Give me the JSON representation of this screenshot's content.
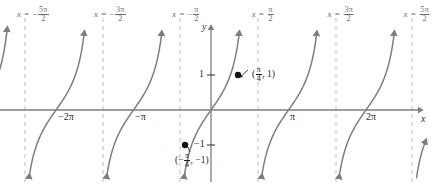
{
  "figure": {
    "background_color": "#ffffff",
    "curve_color": "#7a7f83",
    "axis_color": "#7a7f83",
    "asymptote_color": "#b9bdc0",
    "point_color": "#111111"
  },
  "axes": {
    "x_letter": "x",
    "y_letter": "y",
    "x_axis_y_px": 110,
    "y_axis_x_px": 211,
    "px_per_unit_x": 24.67,
    "px_per_unit_y": 35
  },
  "x_ticks": [
    {
      "label": "−2π",
      "value": -6.2832,
      "x_px": 56
    },
    {
      "label": "−π",
      "value": -3.1416,
      "x_px": 133
    },
    {
      "label": "π",
      "value": 3.1416,
      "x_px": 288
    },
    {
      "label": "2π",
      "value": 6.2832,
      "x_px": 365
    }
  ],
  "y_ticks": [
    {
      "label": "1",
      "value": 1,
      "y_px": 75
    },
    {
      "label": "−1",
      "value": -1,
      "y_px": 145
    }
  ],
  "asymptotes": [
    {
      "id": "a-5pi-2",
      "sign": "−",
      "numerator": "5π",
      "denominator": "2",
      "equals": "x =",
      "value": -7.854,
      "x_px": 25,
      "label_x_px": 33,
      "label_y_px": 6
    },
    {
      "id": "a-3pi-2",
      "sign": "−",
      "numerator": "3π",
      "denominator": "2",
      "equals": "x =",
      "value": -4.712,
      "x_px": 103,
      "label_x_px": 110,
      "label_y_px": 6
    },
    {
      "id": "a-1pi-2",
      "sign": "−",
      "numerator": "π",
      "denominator": "2",
      "equals": "x =",
      "value": -1.571,
      "x_px": 180,
      "label_x_px": 186,
      "label_y_px": 6
    },
    {
      "id": "a+1pi-2",
      "sign": "",
      "numerator": "π",
      "denominator": "2",
      "equals": "x =",
      "value": 1.571,
      "x_px": 258,
      "label_x_px": 263,
      "label_y_px": 6
    },
    {
      "id": "a+3pi-2",
      "sign": "",
      "numerator": "3π",
      "denominator": "2",
      "equals": "x =",
      "value": 4.712,
      "x_px": 336,
      "label_x_px": 341,
      "label_y_px": 6
    },
    {
      "id": "a+5pi-2",
      "sign": "",
      "numerator": "5π",
      "denominator": "2",
      "equals": "x =",
      "value": 7.854,
      "x_px": 412,
      "label_x_px": 417,
      "label_y_px": 6
    }
  ],
  "points": [
    {
      "id": "p-positive",
      "open_paren": "(",
      "sign": "",
      "numerator": "π",
      "denominator": "4",
      "rest": ", 1)",
      "x_value": 0.7854,
      "y_value": 1,
      "x_px": 238,
      "y_px": 75,
      "label_x_px": 252,
      "label_y_px": 68,
      "leader_to_x": 248,
      "leader_to_y": 70
    },
    {
      "id": "p-negative",
      "open_paren": "(",
      "sign": "−",
      "numerator": "π",
      "denominator": "4",
      "rest": ", −1)",
      "x_value": -0.7854,
      "y_value": -1,
      "x_px": 185,
      "y_px": 145,
      "label_x_px": 177,
      "label_y_px": 153,
      "leader_to_x": 190,
      "leader_to_y": 152
    }
  ],
  "chart_data": {
    "type": "line",
    "xlabel": "x",
    "ylabel": "y",
    "xlim": [
      -8.7,
      8.7
    ],
    "ylim": [
      -1.57,
      1.57
    ],
    "grid": false,
    "legend": null,
    "function": "tan",
    "period": 3.14159,
    "x_tick_values": [
      -6.2832,
      -3.1416,
      3.1416,
      6.2832
    ],
    "x_tick_labels": [
      "−2π",
      "−π",
      "π",
      "2π"
    ],
    "y_tick_values": [
      1,
      -1
    ],
    "y_tick_labels": [
      "1",
      "−1"
    ],
    "vertical_asymptotes": [
      -7.854,
      -4.712,
      -1.571,
      1.571,
      4.712,
      7.854
    ],
    "annotated_points": [
      {
        "x": 0.7854,
        "y": 1,
        "label": "(π/4, 1)"
      },
      {
        "x": -0.7854,
        "y": -1,
        "label": "(−π/4, −1)"
      }
    ],
    "branches": [
      {
        "center": -6.2832,
        "x_from": -7.854,
        "x_to": -4.712
      },
      {
        "center": -3.1416,
        "x_from": -4.712,
        "x_to": -1.571
      },
      {
        "center": 0,
        "x_from": -1.571,
        "x_to": 1.571
      },
      {
        "center": 3.1416,
        "x_from": 1.571,
        "x_to": 4.712
      },
      {
        "center": 6.2832,
        "x_from": 4.712,
        "x_to": 7.854
      }
    ]
  }
}
